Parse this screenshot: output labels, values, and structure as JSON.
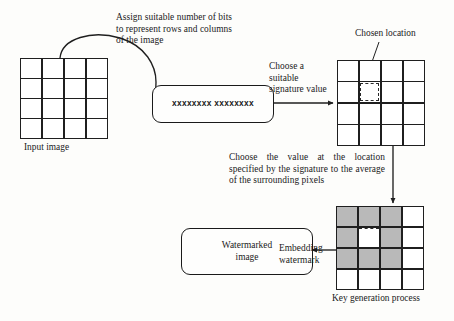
{
  "diagram": {
    "annotations": {
      "assign_bits": "Assign suitable number of bits\nto represent rows and columns\nof the image",
      "choose_signature": "Choose a\nsuitable\nsignature value",
      "chosen_location": "Chosen location",
      "choose_value": "Choose the value at the location specified by the signature to the average of the surrounding pixels",
      "embedding_watermark": "Embedding\nwatermark"
    },
    "nodes": {
      "input_image_caption": "Input image",
      "signature_box_value": "xxxxxxxx xxxxxxxx",
      "watermarked_box_label": "Watermarked\nimage",
      "key_generation_caption": "Key generation process"
    },
    "grids": {
      "input_image": {
        "rows": 4,
        "cols": 4,
        "cells": [
          [
            "plain",
            "plain",
            "plain",
            "plain"
          ],
          [
            "plain",
            "plain",
            "plain",
            "plain"
          ],
          [
            "plain",
            "plain",
            "plain",
            "plain"
          ],
          [
            "plain",
            "plain",
            "plain",
            "plain"
          ]
        ]
      },
      "chosen_location_grid": {
        "rows": 4,
        "cols": 4,
        "selected_cell": {
          "row": 2,
          "col": 2
        },
        "cells": [
          [
            "plain",
            "plain",
            "plain",
            "plain"
          ],
          [
            "plain",
            "selected",
            "plain",
            "plain"
          ],
          [
            "plain",
            "plain",
            "plain",
            "plain"
          ],
          [
            "plain",
            "plain",
            "plain",
            "plain"
          ]
        ]
      },
      "key_generation_grid": {
        "rows": 4,
        "cols": 4,
        "center_cell": {
          "row": 2,
          "col": 2
        },
        "cells": [
          [
            "shaded",
            "shaded",
            "shaded",
            "plain"
          ],
          [
            "shaded",
            "center",
            "shaded",
            "plain"
          ],
          [
            "shaded",
            "shaded",
            "shaded",
            "plain"
          ],
          [
            "plain",
            "plain",
            "plain",
            "plain"
          ]
        ]
      }
    },
    "colors": {
      "stroke": "#1f1f1f",
      "shaded_cell": "#b9b9b9",
      "plain_cell": "#ffffff",
      "background": "#fdfdfb",
      "text": "#1b1b1b"
    },
    "connectors": [
      {
        "name": "input-to-signature",
        "style": "curved-arrow"
      },
      {
        "name": "signature-to-location-grid",
        "style": "straight-arrow"
      },
      {
        "name": "location-grid-to-key-grid",
        "style": "straight-arrow-down"
      },
      {
        "name": "key-grid-to-watermarked",
        "style": "straight-arrow-left"
      },
      {
        "name": "chosen-location-leader",
        "style": "leader-line"
      }
    ]
  }
}
